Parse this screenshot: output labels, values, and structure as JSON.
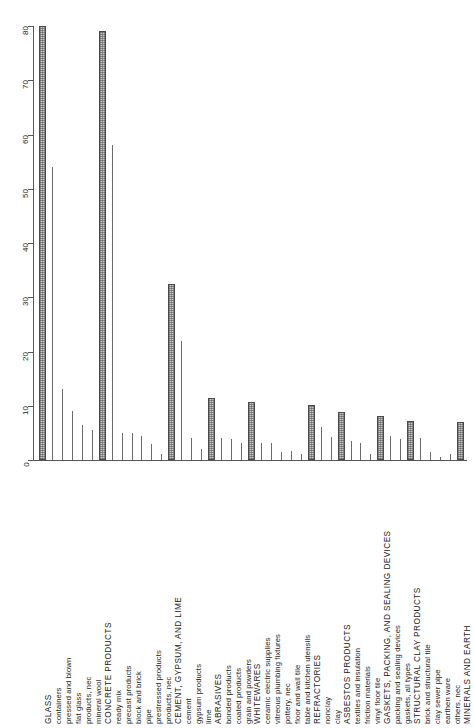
{
  "chart_data": {
    "type": "bar",
    "title": "",
    "subtitle": "",
    "xlabel": "",
    "ylabel": "",
    "ylim": [
      0,
      80
    ],
    "yticks": [
      0,
      10,
      20,
      30,
      40,
      50,
      60,
      70,
      80
    ],
    "grid": false,
    "legend": null,
    "orientation": "vertical",
    "tick_label_rotation": -90,
    "category_label_rotation": -90,
    "bar_styles": {
      "major": "wide shaded/hatched bar with dark outline",
      "sub": "thin single-pixel line bar"
    },
    "colors": {
      "major_fill": "#c9c9c9",
      "major_outline": "#4a4a4a",
      "sub_line": "#6a6a6a",
      "axis": "#555555",
      "text": "#1a1a1a",
      "background": "#ffffff"
    },
    "categories": [
      {
        "label": "GLASS",
        "level": "major",
        "value": 80
      },
      {
        "label": "containers",
        "level": "sub",
        "value": 54
      },
      {
        "label": "pressed and blown",
        "level": "sub",
        "value": 13
      },
      {
        "label": "flat glass",
        "level": "sub",
        "value": 9
      },
      {
        "label": "products, nec",
        "level": "sub",
        "value": 6.5
      },
      {
        "label": "mineral wool",
        "level": "sub",
        "value": 5.5
      },
      {
        "label": "CONCRETE PRODUCTS",
        "level": "major",
        "value": 79
      },
      {
        "label": "ready mix",
        "level": "sub",
        "value": 58
      },
      {
        "label": "precast products",
        "level": "sub",
        "value": 5
      },
      {
        "label": "block and brick",
        "level": "sub",
        "value": 5
      },
      {
        "label": "pipe",
        "level": "sub",
        "value": 4.5
      },
      {
        "label": "prestressed products",
        "level": "sub",
        "value": 3
      },
      {
        "label": "products, nec",
        "level": "sub",
        "value": 1.2
      },
      {
        "label": "CEMENT, GYPSUM, AND LIME",
        "level": "major",
        "value": 32.5
      },
      {
        "label": "cement",
        "level": "sub",
        "value": 22
      },
      {
        "label": "gypsum products",
        "level": "sub",
        "value": 4
      },
      {
        "label": "lime",
        "level": "sub",
        "value": 2
      },
      {
        "label": "ABRASIVES",
        "level": "major",
        "value": 11.5
      },
      {
        "label": "bonded products",
        "level": "sub",
        "value": 4
      },
      {
        "label": "coated products",
        "level": "sub",
        "value": 3.8
      },
      {
        "label": "grain and powders",
        "level": "sub",
        "value": 3.2
      },
      {
        "label": "WHITEWARES",
        "level": "major",
        "value": 10.7
      },
      {
        "label": "ceramic electric supplies",
        "level": "sub",
        "value": 3.2
      },
      {
        "label": "vitreous plumbing fixtures",
        "level": "sub",
        "value": 3.2
      },
      {
        "label": "pottery, nec",
        "level": "sub",
        "value": 1.5
      },
      {
        "label": "floor and wall tile",
        "level": "sub",
        "value": 1.6
      },
      {
        "label": "table and kitchen utensils",
        "level": "sub",
        "value": 1.2
      },
      {
        "label": "REFRACTORIES",
        "level": "major",
        "value": 10.2
      },
      {
        "label": "nonclay",
        "level": "sub",
        "value": 6
      },
      {
        "label": "clay",
        "level": "sub",
        "value": 4.2
      },
      {
        "label": "ASBESTOS PRODUCTS",
        "level": "major",
        "value": 8.8
      },
      {
        "label": "textiles and insulation",
        "level": "sub",
        "value": 3.5
      },
      {
        "label": "friction materials",
        "level": "sub",
        "value": 3.2
      },
      {
        "label": "vinyl floor tile",
        "level": "sub",
        "value": 1.1
      },
      {
        "label": "GASKETS, PACKING, AND SEALING DEVICES",
        "level": "major",
        "value": 8.2
      },
      {
        "label": "packing and sealing devices",
        "level": "sub",
        "value": 4.5
      },
      {
        "label": "gaskets, all types",
        "level": "sub",
        "value": 3.8
      },
      {
        "label": "STRUCTURAL CLAY PRODUCTS",
        "level": "major",
        "value": 7.2
      },
      {
        "label": "brick and structural tile",
        "level": "sub",
        "value": 4
      },
      {
        "label": "clay sewer pipe",
        "level": "sub",
        "value": 1.4
      },
      {
        "label": "earthen ware",
        "level": "sub",
        "value": 0.6
      },
      {
        "label": "others, nec",
        "level": "sub",
        "value": 1.2
      },
      {
        "label": "MINERALS AND EARTH",
        "level": "major",
        "value": 7
      }
    ]
  }
}
